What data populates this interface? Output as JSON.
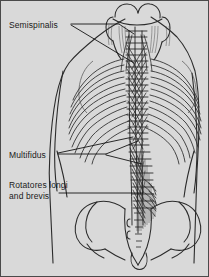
{
  "figure": {
    "background_color": "#d9d9d9",
    "border_color": "#4a4a4a",
    "ink_color": "#2b2b2b",
    "width": 209,
    "height": 277
  },
  "labels": {
    "semispinalis": "Semispinalis",
    "multifidus": "Multifidus",
    "rotatores_line1": "Rotatores longi",
    "rotatores_line2": "and brevis"
  },
  "anatomy": {
    "view": "posterior",
    "structures": [
      "skull base",
      "cervical vertebrae",
      "thoracic vertebrae",
      "lumbar vertebrae",
      "ribcage",
      "sacrum",
      "coccyx",
      "iliac crest",
      "torso outline",
      "semispinalis muscle",
      "multifidus muscle",
      "rotatores longi and brevis muscles"
    ]
  }
}
